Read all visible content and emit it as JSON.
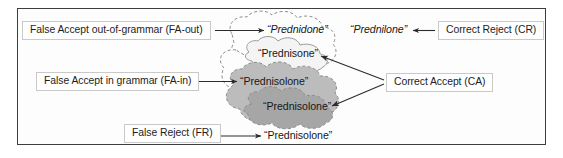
{
  "figure": {
    "frame_border_color": "#3d3d3d",
    "background_color": "#ffffff"
  },
  "callouts": [
    {
      "id": "fa-out",
      "label": "False Accept out-of-grammar (FA-out)",
      "points_to": "Prednidone"
    },
    {
      "id": "fa-in",
      "label": "False Accept in grammar (FA-in)",
      "points_to": "Prednisolone"
    },
    {
      "id": "fr",
      "label": "False Reject (FR)",
      "points_to": "Prednisolone"
    },
    {
      "id": "cr",
      "label": "Correct Reject (CR)",
      "points_to": "Prednilone"
    },
    {
      "id": "ca",
      "label": "Correct Accept (CA)",
      "points_to": "Prednisone and Prednisolone"
    }
  ],
  "words": {
    "prednidone": "“Prednidone”",
    "prednilone": "“Prednilone”",
    "prednisone": "“Prednisone”",
    "prednisolone_outer": "“Prednisolone”",
    "prednisolone_inner": "“Prednisolone”",
    "prednisolone_bottom": "“Prednisolone”"
  },
  "clouds": [
    {
      "id": "cloud-outer",
      "contains": "“Prednidone”",
      "fill": "#fdfdfd",
      "stroke": "#8d8d8d",
      "stroke_style": "dashed"
    },
    {
      "id": "cloud-prednisone",
      "contains": "“Prednisone”",
      "fill": "#f4f4f4",
      "stroke": "#9a9a9a",
      "stroke_style": "solid"
    },
    {
      "id": "cloud-prednisolone-outer",
      "contains": "“Prednisolone”",
      "fill": "#bcbcbc",
      "stroke": "#8d8d8d",
      "stroke_style": "dashed"
    },
    {
      "id": "cloud-prednisolone-inner",
      "contains": "“Prednisolone”",
      "fill": "#a6a6a6",
      "stroke": "#8d8d8d",
      "stroke_style": "dashed"
    }
  ]
}
